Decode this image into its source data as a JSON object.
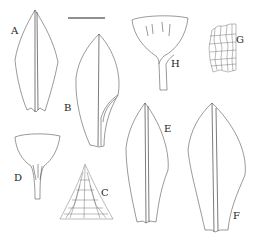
{
  "plate": {
    "type": "botanical line illustration",
    "background": "#ffffff",
    "line_color": "#555555",
    "scale_bar": {
      "present": true,
      "label": ""
    },
    "figures": [
      {
        "id": "A",
        "label": "A",
        "description": "leaf"
      },
      {
        "id": "B",
        "label": "B",
        "description": "leaf"
      },
      {
        "id": "C",
        "label": "C",
        "description": "leaf apex cells"
      },
      {
        "id": "D",
        "label": "D",
        "description": "leaf base / perichaetial structure"
      },
      {
        "id": "E",
        "label": "E",
        "description": "leaf"
      },
      {
        "id": "F",
        "label": "F",
        "description": "leaf"
      },
      {
        "id": "G",
        "label": "G",
        "description": "leaf cells"
      },
      {
        "id": "H",
        "label": "H",
        "description": "capsule"
      }
    ]
  }
}
